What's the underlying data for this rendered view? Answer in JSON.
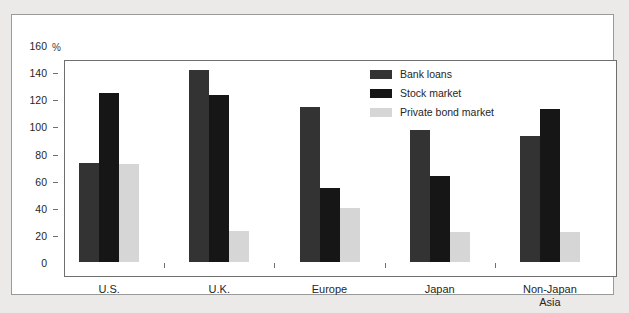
{
  "chart_data": {
    "type": "bar",
    "title": "",
    "subtitle": "",
    "xlabel": "",
    "ylabel": "%",
    "unit_label": "%",
    "ylim": [
      0,
      160
    ],
    "yticks": [
      0,
      20,
      40,
      60,
      80,
      100,
      120,
      140,
      160
    ],
    "ytick_labels": [
      "0",
      "20",
      "40",
      "60",
      "80",
      "100",
      "120",
      "140",
      "160"
    ],
    "grid": false,
    "legend_position": "top-right",
    "categories": [
      "U.S.",
      "U.K.",
      "Europe",
      "Japan",
      "Non-Japan\nAsia"
    ],
    "category_labels": [
      "U.S.",
      "U.K.",
      "Europe",
      "Japan",
      "Non-Japan Asia"
    ],
    "series": [
      {
        "name": "Bank loans",
        "color": "#333333",
        "values": [
          74,
          143,
          115,
          98,
          94
        ]
      },
      {
        "name": "Stock market",
        "color": "#161616",
        "values": [
          126,
          124,
          55,
          64,
          114
        ]
      },
      {
        "name": "Private bond market",
        "color": "#d6d6d6",
        "values": [
          73,
          23,
          40,
          22,
          22
        ]
      }
    ]
  },
  "colors": {
    "page_background": "#eceae8",
    "card_background": "#ffffff",
    "card_border": "#9a9a9a",
    "axis": "#6e6e6e",
    "text": "#262626",
    "bank_loans": "#333333",
    "stock_market": "#161616",
    "private_bond_market": "#d6d6d6"
  }
}
